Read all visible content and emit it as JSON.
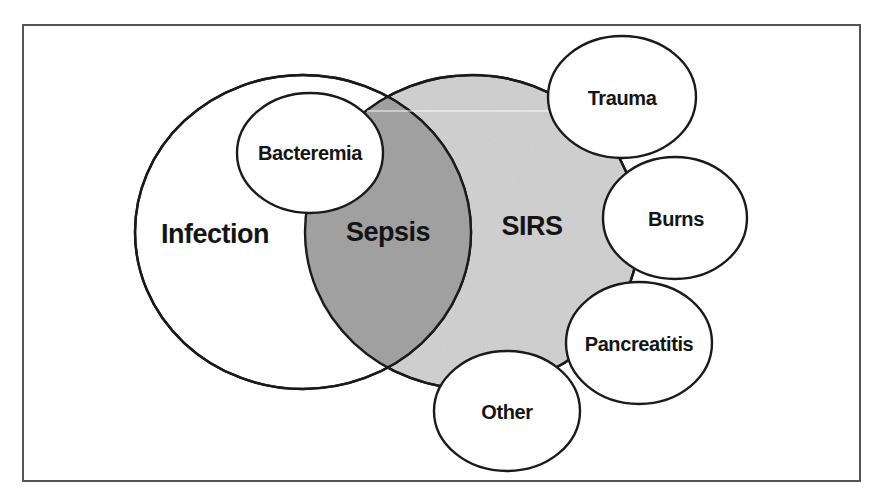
{
  "diagram": {
    "colors": {
      "frame": "#555555",
      "outline": "#1a1a1a",
      "infection_fill": "#ffffff",
      "sirs_fill": "#d3d3d3",
      "sepsis_fill": "#a4a4a4",
      "cause_fill": "#ffffff",
      "text": "#141414"
    },
    "main_sets": [
      {
        "id": "infection",
        "label": "Infection",
        "fill": "white"
      },
      {
        "id": "sirs",
        "label": "SIRS",
        "fill": "light-gray"
      }
    ],
    "intersection": {
      "id": "sepsis",
      "label": "Sepsis",
      "of": [
        "Infection",
        "SIRS"
      ],
      "fill": "dark-gray"
    },
    "subset": {
      "id": "bacteremia",
      "label": "Bacteremia",
      "within": "Infection"
    },
    "sirs_causes": [
      {
        "id": "trauma",
        "label": "Trauma"
      },
      {
        "id": "burns",
        "label": "Burns"
      },
      {
        "id": "pancreatitis",
        "label": "Pancreatitis"
      },
      {
        "id": "other",
        "label": "Other"
      }
    ]
  }
}
